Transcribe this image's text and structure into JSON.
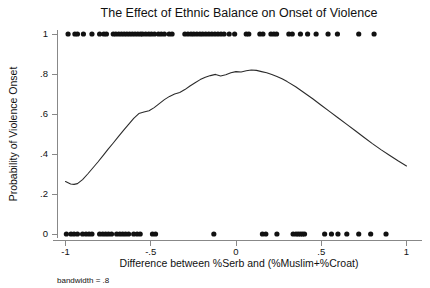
{
  "chart_data": {
    "type": "line",
    "title": "The Effect of Ethnic Balance on Onset of Violence",
    "xlabel": "Difference between %Serb and (%Muslim+%Croat)",
    "ylabel": "Probability of Violence Onset",
    "note": "bandwidth = .8",
    "xlim": [
      -1.05,
      1.05
    ],
    "ylim": [
      0,
      1
    ],
    "grid": false,
    "legend": null,
    "xticks": [
      -1,
      -0.5,
      0,
      0.5,
      1
    ],
    "xticklabels": [
      "-1",
      "-.5",
      "0",
      ".5",
      "1"
    ],
    "yticks": [
      0,
      0.2,
      0.4,
      0.6,
      0.8,
      1
    ],
    "yticklabels": [
      "0",
      ".2",
      ".4",
      ".6",
      ".8",
      "1"
    ],
    "series": [
      {
        "name": "Lowess smoothed probability of violence onset",
        "type": "line",
        "x": [
          -1.0,
          -0.97,
          -0.95,
          -0.93,
          -0.9,
          -0.87,
          -0.84,
          -0.81,
          -0.78,
          -0.75,
          -0.72,
          -0.69,
          -0.66,
          -0.63,
          -0.6,
          -0.57,
          -0.54,
          -0.51,
          -0.48,
          -0.45,
          -0.42,
          -0.39,
          -0.36,
          -0.33,
          -0.3,
          -0.27,
          -0.24,
          -0.21,
          -0.18,
          -0.15,
          -0.12,
          -0.09,
          -0.06,
          -0.03,
          0.0,
          0.03,
          0.06,
          0.09,
          0.12,
          0.15,
          0.18,
          0.21,
          0.24,
          0.27,
          0.3,
          0.35,
          0.4,
          0.45,
          0.5,
          0.55,
          0.6,
          0.65,
          0.7,
          0.75,
          0.8,
          0.85,
          0.9,
          0.95,
          1.0
        ],
        "y": [
          0.262,
          0.25,
          0.248,
          0.252,
          0.272,
          0.3,
          0.33,
          0.36,
          0.392,
          0.424,
          0.455,
          0.487,
          0.518,
          0.548,
          0.578,
          0.602,
          0.61,
          0.616,
          0.632,
          0.652,
          0.672,
          0.688,
          0.7,
          0.708,
          0.722,
          0.74,
          0.756,
          0.772,
          0.784,
          0.792,
          0.798,
          0.79,
          0.796,
          0.806,
          0.812,
          0.81,
          0.816,
          0.82,
          0.818,
          0.812,
          0.806,
          0.798,
          0.788,
          0.776,
          0.762,
          0.736,
          0.706,
          0.676,
          0.644,
          0.612,
          0.58,
          0.548,
          0.516,
          0.484,
          0.452,
          0.422,
          0.394,
          0.366,
          0.34
        ]
      },
      {
        "name": "Observations with violence onset = 1",
        "type": "scatter",
        "y_value": 1,
        "x": [
          -0.985,
          -0.945,
          -0.93,
          -0.895,
          -0.845,
          -0.8,
          -0.775,
          -0.76,
          -0.72,
          -0.705,
          -0.688,
          -0.672,
          -0.656,
          -0.64,
          -0.624,
          -0.608,
          -0.592,
          -0.576,
          -0.56,
          -0.548,
          -0.53,
          -0.512,
          -0.496,
          -0.478,
          -0.455,
          -0.438,
          -0.42,
          -0.392,
          -0.375,
          -0.3,
          -0.282,
          -0.264,
          -0.248,
          -0.23,
          -0.212,
          -0.196,
          -0.178,
          -0.16,
          -0.142,
          -0.124,
          -0.106,
          -0.088,
          -0.07,
          -0.04,
          -0.008,
          0.06,
          0.075,
          0.14,
          0.158,
          0.205,
          0.222,
          0.238,
          0.31,
          0.33,
          0.378,
          0.42,
          0.47,
          0.54,
          0.595,
          0.72,
          0.81
        ]
      },
      {
        "name": "Observations with violence onset = 0",
        "type": "scatter",
        "y_value": 0,
        "x": [
          -0.995,
          -0.968,
          -0.95,
          -0.93,
          -0.9,
          -0.88,
          -0.862,
          -0.845,
          -0.8,
          -0.782,
          -0.765,
          -0.748,
          -0.73,
          -0.7,
          -0.682,
          -0.665,
          -0.648,
          -0.63,
          -0.6,
          -0.58,
          -0.562,
          -0.49,
          -0.472,
          -0.13,
          0.155,
          0.175,
          0.24,
          0.335,
          0.352,
          0.365,
          0.378,
          0.39,
          0.402,
          0.52,
          0.56,
          0.598,
          0.65,
          0.72,
          0.79,
          0.88
        ]
      }
    ]
  },
  "layout": {
    "plot_left": 57,
    "plot_right": 415,
    "plot_top": 34,
    "plot_bottom": 234
  }
}
